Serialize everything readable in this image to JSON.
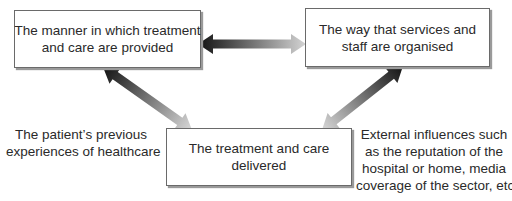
{
  "diagram": {
    "boxes": {
      "manner": {
        "lines": [
          "The manner in which treatment",
          "and care are provided"
        ]
      },
      "organised": {
        "lines": [
          "The way that services and",
          "staff are organised"
        ]
      },
      "delivered": {
        "lines": [
          "The treatment and care",
          "delivered"
        ]
      }
    },
    "notes": {
      "patient": {
        "lines": [
          "The patient’s previous",
          "experiences of healthcare"
        ]
      },
      "external": {
        "lines": [
          "External influences such",
          "as the reputation of the",
          "hospital or home, media",
          "coverage of the sector, etc."
        ]
      }
    },
    "arrows": [
      {
        "id": "manner-organised",
        "from": "manner",
        "to": "organised",
        "dark_end": "manner",
        "light_end": "organised"
      },
      {
        "id": "manner-delivered",
        "from": "manner",
        "to": "delivered",
        "dark_end": "manner",
        "light_end": "delivered"
      },
      {
        "id": "organised-delivered",
        "from": "organised",
        "to": "delivered",
        "dark_end": "organised",
        "light_end": "delivered"
      }
    ],
    "colors": {
      "arrow_dark": "#111111",
      "arrow_light": "#d4d4d4",
      "box_border": "#6a6a6a",
      "text": "#2a2a2a"
    }
  }
}
